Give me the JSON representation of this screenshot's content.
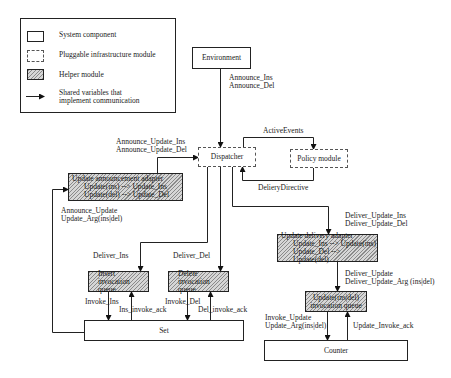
{
  "legend": {
    "items": [
      {
        "type": "system-component",
        "label": "System component"
      },
      {
        "type": "pluggable-module",
        "label": "Pluggable infrastructure module"
      },
      {
        "type": "helper-module",
        "label": "Helper module"
      },
      {
        "type": "shared-variable-arrow",
        "label_line1": "Shared variables that",
        "label_line2": "implement communication"
      }
    ]
  },
  "nodes": {
    "environment": "Environment",
    "dispatcher": "Dispatcher",
    "policy_module": "Policy module",
    "announce_adapter": {
      "title": "Update announcement adapter",
      "line1": "Update(ins) --> Update_Ins",
      "line2": "Update(del) --> Update_Del"
    },
    "delivery_adapter": {
      "title": "Update delivery adapter",
      "line1": "Update_Ins --> Update(ins)",
      "line2": "Update_Del --> Update(del)"
    },
    "insert_queue": {
      "line1": "Insert",
      "line2": "invocation queue"
    },
    "delete_queue": {
      "line1": "Delete",
      "line2": "invocation queue"
    },
    "update_queue": {
      "line1": "Update(ins|del)",
      "line2": "invocation queue"
    },
    "set": "Set",
    "counter": "Counter"
  },
  "edge_labels": {
    "announce_ins": "Announce_Ins",
    "announce_del": "Announce_Del",
    "announce_update_ins": "Announce_Update_Ins",
    "announce_update_del": "Announce_Update_Del",
    "active_events": "ActiveEvents",
    "delivery_directive": "DelieryDirective",
    "announce_update": "Announce_Update",
    "update_arg": "Update_Arg(ins|del)",
    "deliver_update_ins": "Deliver_Update_Ins",
    "deliver_update_del": "Deliver_Update_Del",
    "deliver_ins": "Deliver_Ins",
    "deliver_del": "Deliver_Del",
    "deliver_update": "Deliver_Update",
    "deliver_update_arg": "Deliver_Update_Arg (ins|del)",
    "invoke_ins": "Invoke_Ins",
    "ins_invoke_ack": "Ins_invoke_ack",
    "invoke_del": "Invoke_Del",
    "del_invoke_ack": "Del_invoke_ack",
    "invoke_update": "Invoke_Update",
    "invoke_update_arg": "Update_Arg(ins|del)",
    "update_invoke_ack": "Update_Invoke_ack"
  }
}
